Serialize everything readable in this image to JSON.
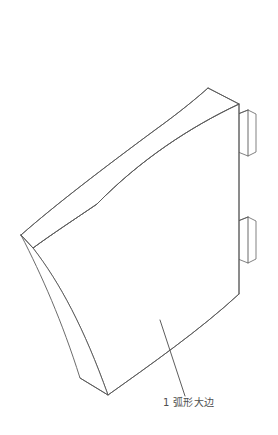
{
  "drawing": {
    "background_color": "#ffffff",
    "line_color": "#5a5a5a",
    "title": "",
    "view": "isometric",
    "part_name": "弧形大边",
    "callout": {
      "number": "1",
      "text": "弧形大边",
      "full_label": "1 弧形大边",
      "text_color": "#4f4f4f",
      "leader_from": "160,320",
      "leader_to": "185,396"
    },
    "components": [
      {
        "name": "curved-top-face",
        "label": "弧形顶面"
      },
      {
        "name": "curved-front-face",
        "label": "弧形正面"
      },
      {
        "name": "left-side-face",
        "label": "左侧面"
      },
      {
        "name": "right-end-face",
        "label": "右端面"
      },
      {
        "name": "mounting-tab-upper",
        "label": "上安装耳"
      },
      {
        "name": "mounting-tab-lower",
        "label": "下安装耳"
      }
    ]
  }
}
